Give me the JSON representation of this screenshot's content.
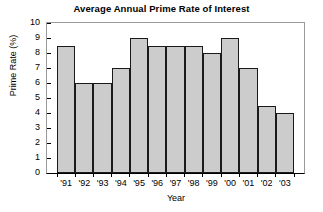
{
  "chart_data": {
    "type": "bar",
    "title": "Average Annual Prime Rate of Interest",
    "xlabel": "Year",
    "ylabel": "Prime Rate (%)",
    "categories": [
      "'91",
      "'92",
      "'93",
      "'94",
      "'95",
      "'96",
      "'97",
      "'98",
      "'99",
      "'00",
      "'01",
      "'02",
      "'03"
    ],
    "values": [
      8.5,
      6.0,
      6.0,
      7.0,
      9.0,
      8.5,
      8.5,
      8.5,
      8.0,
      9.0,
      7.0,
      4.5,
      4.0
    ],
    "ylim": [
      0,
      10
    ],
    "ytick_labels": [
      "0",
      "1",
      "2",
      "3",
      "4",
      "5",
      "6",
      "7",
      "8",
      "9",
      "10"
    ],
    "ytick_values": [
      0,
      1,
      2,
      3,
      4,
      5,
      6,
      7,
      8,
      9,
      10
    ],
    "grid": false,
    "legend": "none",
    "bar_fill_color": "#cccccc",
    "bar_edge_color": "#1a1a1a",
    "frame_color": "#9a9a9a",
    "axis_color": "#000000",
    "background_color": "#ffffff"
  }
}
